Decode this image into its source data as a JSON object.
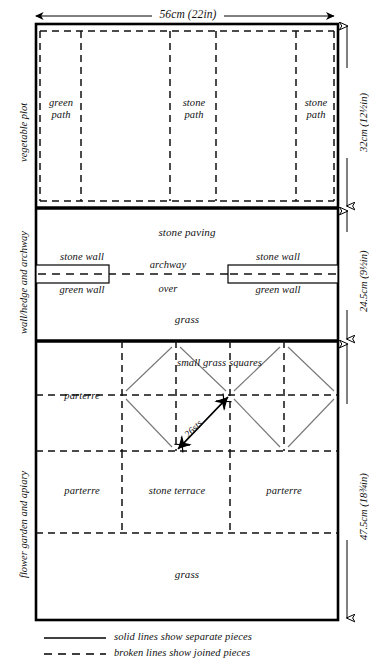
{
  "diagram": {
    "dimensions": {
      "width_top": "56cm (22in)",
      "section1_height": "32cm (12½in)",
      "section2_height": "24.5cm (9½in)",
      "section3_height": "47.5cm (18¾in)"
    },
    "side_labels": [
      {
        "text": "vegetable plot"
      },
      {
        "text": "wall/hedge and archway"
      },
      {
        "text": "flower garden and apiary"
      }
    ],
    "sections": {
      "vegetable_plot": {
        "name": "vegetable plot",
        "cells": [
          {
            "label": "green\npath"
          },
          {
            "label": ""
          },
          {
            "label": "stone\npath"
          },
          {
            "label": ""
          },
          {
            "label": "stone\npath"
          }
        ]
      },
      "wall_archway": {
        "name": "wall/hedge and archway",
        "paving_label": "stone paving",
        "left_wall_top": "stone wall",
        "left_wall_bottom": "green wall",
        "right_wall_top": "stone wall",
        "right_wall_bottom": "green wall",
        "archway_line1": "archway",
        "archway_line2": "over",
        "grass_label": "grass"
      },
      "flower_garden": {
        "name": "flower garden and apiary",
        "grass_squares_label": "small grass squares",
        "stitch_measure": "26sts",
        "parterre_left_upper": "parterre",
        "parterre_left_lower": "parterre",
        "stone_terrace": "stone terrace",
        "parterre_right_lower": "parterre",
        "grass_label": "grass"
      }
    },
    "legend": [
      {
        "style": "solid",
        "text": "solid lines show separate pieces"
      },
      {
        "style": "broken",
        "text": "broken lines show joined pieces"
      }
    ],
    "colors": {
      "ink": "#111111",
      "rule": "#000000",
      "thin": "#555555",
      "paper": "#ffffff"
    }
  }
}
